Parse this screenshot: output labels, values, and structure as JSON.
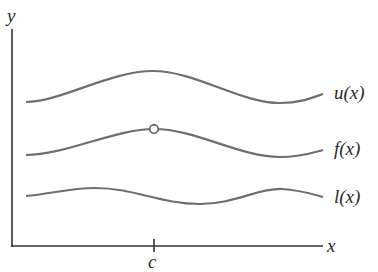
{
  "figure": {
    "axes": {
      "x_label": "x",
      "y_label": "y",
      "tick_label": "c"
    },
    "curves": [
      {
        "name": "upper",
        "label": "u(x)"
      },
      {
        "name": "function",
        "label": "f(x)"
      },
      {
        "name": "lower",
        "label": "l(x)"
      }
    ],
    "marker": {
      "type": "open-circle",
      "at": "c",
      "on_curve": "f(x)"
    }
  },
  "colors": {
    "axis": "#333333",
    "curve": "#6f6f6f",
    "background": "#ffffff"
  }
}
